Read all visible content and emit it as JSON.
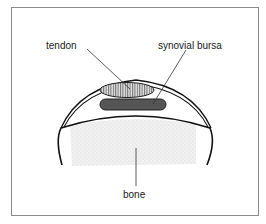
{
  "diagram": {
    "type": "anatomical-cross-section",
    "labels": {
      "tendon": "tendon",
      "bursa": "synovial bursa",
      "bone": "bone"
    },
    "colors": {
      "frame": "#8a8a8a",
      "outline": "#111111",
      "tendon_fill": "#d8d8d8",
      "tendon_hatch": "#444444",
      "bursa_fill": "#555555",
      "bone_stipple": "#e2e2e2",
      "leader": "#333333"
    }
  }
}
